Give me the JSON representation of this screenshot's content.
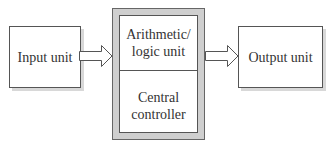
{
  "diagram": {
    "type": "block-diagram",
    "nodes": [
      {
        "id": "input",
        "label": "Input unit"
      },
      {
        "id": "cpu",
        "label": "",
        "sections": [
          {
            "id": "alu",
            "label": "Arithmetic/\nlogic unit"
          },
          {
            "id": "controller",
            "label": "Central\ncontroller"
          }
        ]
      },
      {
        "id": "output",
        "label": "Output unit"
      }
    ],
    "edges": [
      {
        "from": "input",
        "to": "cpu",
        "style": "hollow-block-arrow"
      },
      {
        "from": "cpu",
        "to": "output",
        "style": "hollow-block-arrow"
      }
    ]
  },
  "labels": {
    "input": "Input unit",
    "alu_line1": "Arithmetic/",
    "alu_line2": "logic unit",
    "controller_line1": "Central",
    "controller_line2": "controller",
    "output": "Output unit"
  },
  "colors": {
    "stroke": "#555555",
    "cpu_frame": "#cfcfcf",
    "shadow": "#d8d8d8"
  }
}
